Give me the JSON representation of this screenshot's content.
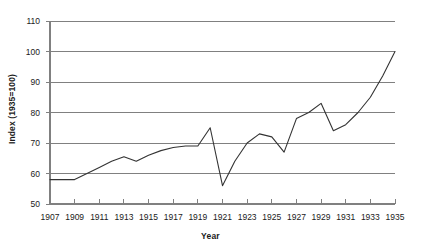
{
  "chart_data": {
    "type": "line",
    "title": "",
    "xlabel": "Year",
    "ylabel": "Index (1935=100)",
    "xlim": [
      1907,
      1935
    ],
    "ylim": [
      50,
      110
    ],
    "ytick_step": 10,
    "xtick_step": 2,
    "grid": true,
    "grid_axis": "y",
    "legend": false,
    "line_color": "#333333",
    "grid_color": "#808080",
    "axis_color": "#808080",
    "background": "#ffffff",
    "ytick_labels": [
      "110",
      "100",
      "90",
      "80",
      "70",
      "60",
      "50"
    ],
    "ytick_values": [
      110,
      100,
      90,
      80,
      70,
      60,
      50
    ],
    "xtick_labels": [
      "1907",
      "1909",
      "1911",
      "1913",
      "1915",
      "1917",
      "1919",
      "1921",
      "1923",
      "1925",
      "1927",
      "1929",
      "1931",
      "1933",
      "1935"
    ],
    "xtick_values": [
      1907,
      1909,
      1911,
      1913,
      1915,
      1917,
      1919,
      1921,
      1923,
      1925,
      1927,
      1929,
      1931,
      1933,
      1935
    ],
    "x": [
      1907,
      1908,
      1909,
      1910,
      1911,
      1912,
      1913,
      1914,
      1915,
      1916,
      1917,
      1918,
      1919,
      1920,
      1921,
      1922,
      1923,
      1924,
      1925,
      1926,
      1927,
      1928,
      1929,
      1930,
      1931,
      1932,
      1933,
      1934,
      1935
    ],
    "values": [
      58,
      58,
      58,
      60,
      62,
      64,
      65.5,
      64,
      66,
      67.5,
      68.5,
      69,
      69,
      75,
      56,
      64,
      70,
      73,
      72,
      67,
      78,
      80,
      83,
      74,
      76,
      80,
      85,
      92,
      100
    ],
    "series": [
      {
        "name": "Index (1935=100)",
        "values": [
          58,
          58,
          58,
          60,
          62,
          64,
          65.5,
          64,
          66,
          67.5,
          68.5,
          69,
          69,
          75,
          56,
          64,
          70,
          73,
          72,
          67,
          78,
          80,
          83,
          74,
          76,
          80,
          85,
          92,
          100
        ]
      }
    ]
  },
  "axes": {
    "y_title": "Index (1935=100)",
    "x_title": "Year"
  }
}
